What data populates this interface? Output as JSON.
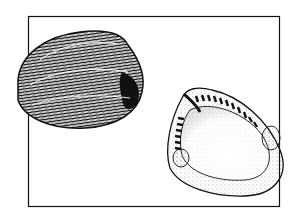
{
  "figure": {
    "panels": [
      {
        "name": "exterior-valve",
        "description": "outer view of clam shell with concentric growth lines"
      },
      {
        "name": "interior-valve",
        "description": "inner view of clam shell showing hinge teeth and muscle scars"
      }
    ],
    "colors": {
      "ink": "#111111",
      "paper": "#ffffff",
      "stipple": "#555555"
    }
  }
}
